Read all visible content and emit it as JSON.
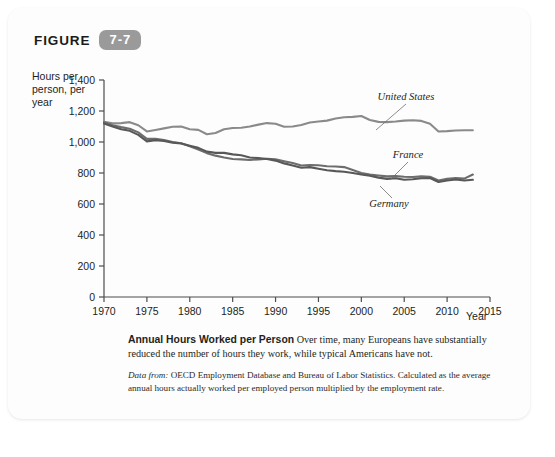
{
  "figure": {
    "word": "FIGURE",
    "number": "7-7"
  },
  "axes": {
    "y_title": "Hours per person, per year",
    "x_title": "Year",
    "y_ticks": [
      "0",
      "200",
      "400",
      "600",
      "800",
      "1,000",
      "1,200",
      "1,400"
    ],
    "x_ticks": [
      "1970",
      "1975",
      "1980",
      "1985",
      "1990",
      "1995",
      "2000",
      "2005",
      "2010",
      "2015"
    ]
  },
  "annotations": {
    "united_states": "United States",
    "france": "France",
    "germany": "Germany"
  },
  "caption": {
    "title": "Annual Hours Worked per Person",
    "body": "Over time, many Europeans have substantially reduced the number of hours they work, while typical Americans have not.",
    "source_label": "Data from:",
    "source_text": "OECD Employment Database and Bureau of Labor Statistics. Calculated as the average annual hours actually worked per employed person multiplied by the employment rate."
  },
  "colors": {
    "united_states": "#8a8a8a",
    "france": "#6d6d6d",
    "germany": "#585858",
    "axis": "#4d4d4d",
    "badge": "#9a9a9a",
    "card": "#fdfdfd"
  },
  "chart_data": {
    "type": "line",
    "title": "Annual Hours Worked per Person",
    "xlabel": "Year",
    "ylabel": "Hours per person, per year",
    "xlim": [
      1970,
      2015
    ],
    "ylim": [
      0,
      1400
    ],
    "ytick_step": 200,
    "xtick_step": 5,
    "grid": false,
    "legend": "inline-annotations",
    "x": [
      1970,
      1971,
      1972,
      1973,
      1974,
      1975,
      1976,
      1977,
      1978,
      1979,
      1980,
      1981,
      1982,
      1983,
      1984,
      1985,
      1986,
      1987,
      1988,
      1989,
      1990,
      1991,
      1992,
      1993,
      1994,
      1995,
      1996,
      1997,
      1998,
      1999,
      2000,
      2001,
      2002,
      2003,
      2004,
      2005,
      2006,
      2007,
      2008,
      2009,
      2010,
      2011,
      2012,
      2013
    ],
    "series": [
      {
        "name": "United States",
        "color": "#8a8a8a",
        "values": [
          1130,
          1120,
          1122,
          1128,
          1108,
          1068,
          1078,
          1088,
          1098,
          1100,
          1082,
          1078,
          1050,
          1058,
          1082,
          1090,
          1092,
          1100,
          1112,
          1122,
          1118,
          1098,
          1100,
          1110,
          1126,
          1132,
          1138,
          1152,
          1160,
          1162,
          1168,
          1142,
          1130,
          1128,
          1132,
          1138,
          1140,
          1136,
          1118,
          1068,
          1070,
          1074,
          1076,
          1076
        ]
      },
      {
        "name": "France",
        "color": "#6d6d6d",
        "values": [
          1128,
          1108,
          1096,
          1086,
          1062,
          1020,
          1020,
          1012,
          1000,
          992,
          972,
          952,
          928,
          912,
          900,
          890,
          888,
          884,
          888,
          892,
          888,
          876,
          864,
          848,
          852,
          850,
          844,
          842,
          838,
          820,
          800,
          790,
          784,
          778,
          780,
          776,
          774,
          778,
          776,
          752,
          762,
          768,
          764,
          790
        ]
      },
      {
        "name": "Germany",
        "color": "#585858",
        "values": [
          1120,
          1100,
          1082,
          1072,
          1046,
          1004,
          1012,
          1006,
          996,
          990,
          976,
          962,
          938,
          930,
          930,
          920,
          914,
          900,
          896,
          890,
          880,
          862,
          848,
          834,
          838,
          828,
          818,
          812,
          808,
          800,
          790,
          782,
          770,
          762,
          766,
          756,
          760,
          766,
          768,
          742,
          752,
          758,
          752,
          756
        ]
      }
    ]
  }
}
